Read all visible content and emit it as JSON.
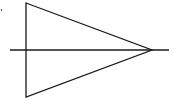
{
  "diagram": {
    "stroke_color": "#1a1a1a",
    "background": "#ffffff",
    "stroke_width": 1.3,
    "triangle": {
      "points": [
        [
          26,
          3
        ],
        [
          152,
          50
        ],
        [
          26,
          97
        ]
      ]
    },
    "axis_line": {
      "x1": 10,
      "y1": 50,
      "x2": 169,
      "y2": 50
    },
    "dot": {
      "cx": 1.5,
      "cy": 10,
      "r": 0.8
    }
  }
}
